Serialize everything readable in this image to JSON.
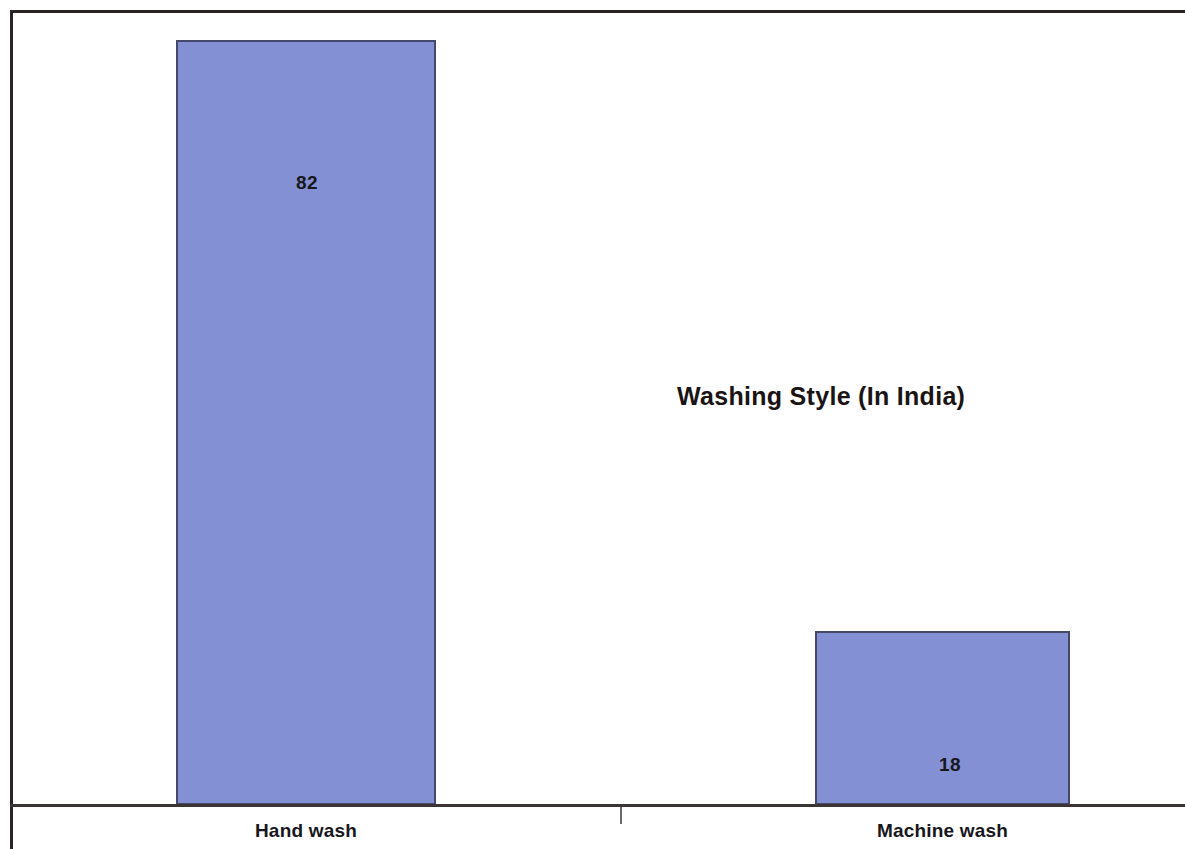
{
  "chart_data": {
    "type": "bar",
    "title": "Washing Style (In India)",
    "xlabel": "",
    "ylabel": "",
    "categories": [
      "Hand wash",
      "Machine wash"
    ],
    "values": [
      82,
      18
    ],
    "value_labels": [
      "82",
      "18"
    ],
    "series": [
      {
        "name": "Washing Style (In India)",
        "values": [
          82,
          18
        ],
        "color": "#8391d4"
      }
    ],
    "ylim": [
      0,
      86
    ],
    "grid": false,
    "legend": false,
    "legend_position": "none",
    "axis_ticks_y": [],
    "axis_ticks_x": [
      "Hand wash",
      "Machine wash"
    ],
    "bar_border_color": "#46486a",
    "value_label_position": "inside",
    "background": "#ffffff",
    "units": "percent"
  },
  "figure": {
    "title": "Washing Style (In India)",
    "title_x": 677,
    "title_y": 382,
    "frame_color": "#2b2424",
    "axis_color": "#3a3434"
  },
  "bars": [
    {
      "label": "Hand wash",
      "value_text": "82",
      "left": 176,
      "top": 40,
      "width": 260,
      "height": 765,
      "value_label_left": 247,
      "value_label_top": 172,
      "category_label_left": 176,
      "category_label_top": 820
    },
    {
      "label": "Machine wash",
      "value_text": "18",
      "left": 815,
      "top": 631,
      "width": 255,
      "height": 174,
      "value_label_left": 890,
      "value_label_top": 754,
      "category_label_left": 815,
      "category_label_top": 820
    }
  ],
  "axis": {
    "tick_x": 620
  }
}
